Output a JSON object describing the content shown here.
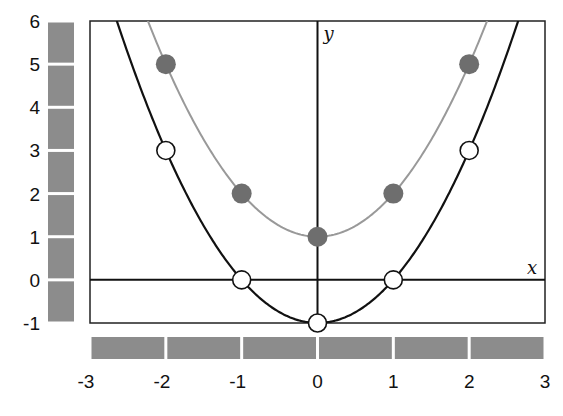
{
  "chart_data": {
    "type": "line",
    "title": "",
    "xlabel": "x",
    "ylabel": "y",
    "xlim": [
      -3,
      3
    ],
    "ylim": [
      -1,
      6
    ],
    "grid": false,
    "legend": null,
    "x_ticks": [
      "-3",
      "-2",
      "-1",
      "0",
      "1",
      "2",
      "3"
    ],
    "y_ticks": [
      "6",
      "5",
      "4",
      "3",
      "2",
      "1",
      "0",
      "-1"
    ],
    "series": [
      {
        "name": "y = x^2 - 1",
        "color": "#111111",
        "marker": "open-circle",
        "x": [
          -2,
          -1,
          0,
          1,
          2
        ],
        "values": [
          3,
          0,
          -1,
          0,
          3
        ]
      },
      {
        "name": "y = x^2 + 1",
        "color": "#999999",
        "marker": "filled-circle",
        "marker_color": "#6e6e6e",
        "x": [
          -2,
          -1,
          0,
          1,
          2
        ],
        "values": [
          5,
          2,
          1,
          2,
          5
        ]
      }
    ],
    "decorations": {
      "x_scale_bars": 6,
      "y_scale_bars": 7,
      "bar_color": "#8c8c8c"
    }
  }
}
